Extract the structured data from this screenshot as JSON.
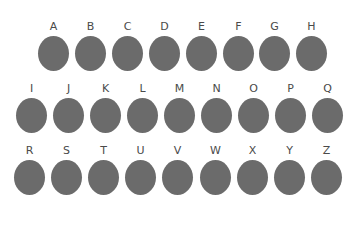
{
  "colors": {
    "dot": "#6b6b6b",
    "label": "#4a4a4a"
  },
  "rows": [
    {
      "top": 21,
      "left": 38,
      "spacing": 36.9,
      "items": [
        "A",
        "B",
        "C",
        "D",
        "E",
        "F",
        "G",
        "H"
      ]
    },
    {
      "top": 83,
      "left": 16,
      "spacing": 37,
      "items": [
        "I",
        "J",
        "K",
        "L",
        "M",
        "N",
        "O",
        "P",
        "Q"
      ]
    },
    {
      "top": 145,
      "left": 14,
      "spacing": 37.1,
      "items": [
        "R",
        "S",
        "T",
        "U",
        "V",
        "W",
        "X",
        "Y",
        "Z"
      ]
    }
  ]
}
